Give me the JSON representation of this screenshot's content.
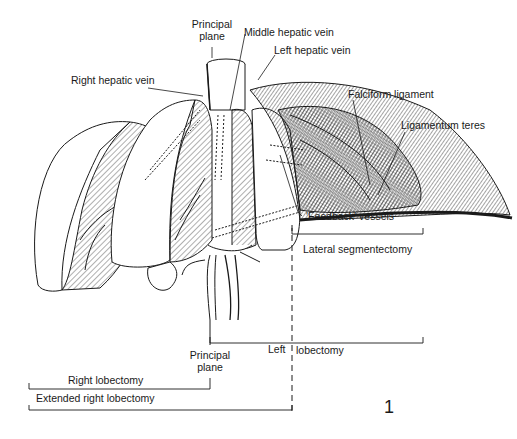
{
  "figure": {
    "number": "1"
  },
  "labels": {
    "principal_plane_top_line1": "Principal",
    "principal_plane_top_line2": "plane",
    "middle_hepatic_vein": "Middle hepatic vein",
    "left_hepatic_vein": "Left hepatic vein",
    "right_hepatic_vein": "Right hepatic vein",
    "falciform_ligament": "Falciform ligament",
    "ligamentum_teres": "Ligamentum teres",
    "feedback_vessels": "'Feedback' vessels",
    "lateral_segmentectomy": "Lateral segmentectomy",
    "left_lobectomy_left": "Left",
    "left_lobectomy_right": "lobectomy",
    "principal_plane_bottom_line1": "Principal",
    "principal_plane_bottom_line2": "plane",
    "right_lobectomy": "Right lobectomy",
    "extended_right_lobectomy": "Extended right lobectomy"
  },
  "colors": {
    "ink": "#1a1a1a",
    "paper": "#ffffff"
  }
}
